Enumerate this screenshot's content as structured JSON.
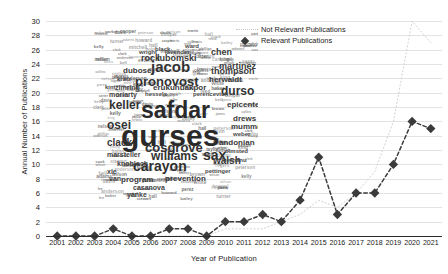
{
  "chart_data": {
    "type": "line",
    "title": "",
    "xlabel": "Year of Publication",
    "ylabel": "Annual Number of Publications",
    "x": [
      2001,
      2002,
      2003,
      2004,
      2005,
      2006,
      2007,
      2008,
      2009,
      2010,
      2011,
      2012,
      2013,
      2014,
      2015,
      2016,
      2017,
      2018,
      2019,
      2020,
      2021
    ],
    "xticks": [
      "2001",
      "2002",
      "2003",
      "2004",
      "2005",
      "2006",
      "2007",
      "2008",
      "2009",
      "2010",
      "2011",
      "2012",
      "2013",
      "2014",
      "2015",
      "2016",
      "2017",
      "2018",
      "2019",
      "2020",
      "2021"
    ],
    "yticks": [
      0,
      2,
      4,
      6,
      8,
      10,
      12,
      14,
      16,
      18,
      20,
      22,
      24,
      26,
      28,
      30
    ],
    "ylim": [
      0,
      31
    ],
    "xlim": [
      2000.4,
      2021.6
    ],
    "grid": true,
    "legend_position": "upper center",
    "series": [
      {
        "name": "Not Relevant Publications",
        "style": "dotted-line",
        "color": "#d2d2d2",
        "marker": "none",
        "values": [
          0,
          0,
          0,
          0,
          0,
          0,
          0,
          0,
          0,
          1,
          1,
          1,
          2,
          3,
          5,
          4,
          6,
          9,
          16,
          30,
          27
        ]
      },
      {
        "name": "Relevant Publications",
        "style": "dashed-line",
        "color": "#3b3b3b",
        "marker": "diamond",
        "values": [
          0,
          0,
          0,
          1,
          0,
          0,
          1,
          1,
          0,
          2,
          2,
          3,
          2,
          5,
          11,
          3,
          6,
          6,
          10,
          16,
          15
        ]
      }
    ]
  },
  "legend": {
    "items": [
      {
        "label": "Not Relevant Publications"
      },
      {
        "label": "Relevant Publications"
      }
    ]
  },
  "wordcloud": {
    "title": "author-name-word-cloud",
    "words": [
      {
        "text": "gurses",
        "size": 30,
        "x": 28,
        "y": 92,
        "rot": 0,
        "weight": 700,
        "color": "#2a2a2a"
      },
      {
        "text": "safdar",
        "size": 23,
        "x": 48,
        "y": 70,
        "rot": 0,
        "weight": 700,
        "color": "#2a2a2a"
      },
      {
        "text": "jacob",
        "size": 15,
        "x": 58,
        "y": 30,
        "rot": 0,
        "weight": 700,
        "color": "#333"
      },
      {
        "text": "pronovost",
        "size": 13,
        "x": 42,
        "y": 46,
        "rot": 0,
        "weight": 700,
        "color": "#333"
      },
      {
        "text": "carayon",
        "size": 14,
        "x": 40,
        "y": 130,
        "rot": 0,
        "weight": 700,
        "color": "#2f2f2f"
      },
      {
        "text": "cosgrove",
        "size": 13,
        "x": 52,
        "y": 112,
        "rot": 0,
        "weight": 700,
        "color": "#333"
      },
      {
        "text": "williams",
        "size": 12,
        "x": 58,
        "y": 121,
        "rot": 0,
        "weight": 700,
        "color": "#333"
      },
      {
        "text": "keller",
        "size": 12,
        "x": 16,
        "y": 70,
        "rot": 0,
        "weight": 700,
        "color": "#333"
      },
      {
        "text": "durso",
        "size": 12,
        "x": 128,
        "y": 56,
        "rot": 0,
        "weight": 700,
        "color": "#333"
      },
      {
        "text": "osei",
        "size": 12,
        "x": 14,
        "y": 90,
        "rot": 0,
        "weight": 700,
        "color": "#333"
      },
      {
        "text": "clack",
        "size": 10,
        "x": 14,
        "y": 109,
        "rot": 0,
        "weight": 700,
        "color": "#3a3a3a"
      },
      {
        "text": "sax",
        "size": 14,
        "x": 110,
        "y": 119,
        "rot": 0,
        "weight": 700,
        "color": "#2f2f2f"
      },
      {
        "text": "walsh",
        "size": 10,
        "x": 120,
        "y": 127,
        "rot": 0,
        "weight": 700,
        "color": "#3a3a3a"
      },
      {
        "text": "martinez",
        "size": 9,
        "x": 126,
        "y": 33,
        "rot": 0,
        "weight": 700,
        "color": "#3a3a3a"
      },
      {
        "text": "thompson",
        "size": 9,
        "x": 118,
        "y": 38,
        "rot": 0,
        "weight": 700,
        "color": "#3a3a3a"
      },
      {
        "text": "chen",
        "size": 9,
        "x": 118,
        "y": 19,
        "rot": 0,
        "weight": 700,
        "color": "#3a3a3a"
      },
      {
        "text": "rock",
        "size": 9,
        "x": 48,
        "y": 25,
        "rot": 0,
        "weight": 700,
        "color": "#3a3a3a"
      },
      {
        "text": "lubomski",
        "size": 9,
        "x": 64,
        "y": 25,
        "rot": 0,
        "weight": 700,
        "color": "#3a3a3a"
      },
      {
        "text": "dubose",
        "size": 8,
        "x": 30,
        "y": 38,
        "rot": 0,
        "weight": 700,
        "color": "#3a3a3a"
      },
      {
        "text": "erukunuakpor",
        "size": 8,
        "x": 60,
        "y": 55,
        "rot": 0,
        "weight": 700,
        "color": "#3a3a3a"
      },
      {
        "text": "herwaldt",
        "size": 8,
        "x": 116,
        "y": 47,
        "rot": 0,
        "weight": 700,
        "color": "#3a3a3a"
      },
      {
        "text": "epicenters",
        "size": 8,
        "x": 134,
        "y": 72,
        "rot": 0,
        "weight": 700,
        "color": "#3a3a3a"
      },
      {
        "text": "drews",
        "size": 8,
        "x": 140,
        "y": 86,
        "rot": 0,
        "weight": 700,
        "color": "#3a3a3a"
      },
      {
        "text": "mumma",
        "size": 8,
        "x": 138,
        "y": 94,
        "rot": 0,
        "weight": 700,
        "color": "#3a3a3a"
      },
      {
        "text": "andonian",
        "size": 8,
        "x": 126,
        "y": 110,
        "rot": 0,
        "weight": 700,
        "color": "#3a3a3a"
      },
      {
        "text": "zimring",
        "size": 7,
        "x": 22,
        "y": 55,
        "rot": 0,
        "weight": 700,
        "color": "#444"
      },
      {
        "text": "moriarty",
        "size": 7,
        "x": 16,
        "y": 62,
        "rot": 0,
        "weight": 700,
        "color": "#444"
      },
      {
        "text": "marsteller",
        "size": 7,
        "x": 14,
        "y": 122,
        "rot": 0,
        "weight": 700,
        "color": "#444"
      },
      {
        "text": "knobloch",
        "size": 7,
        "x": 24,
        "y": 131,
        "rot": 0,
        "weight": 700,
        "color": "#444"
      },
      {
        "text": "xie",
        "size": 7,
        "x": 14,
        "y": 139,
        "rot": 0,
        "weight": 700,
        "color": "#444"
      },
      {
        "text": "van",
        "size": 7,
        "x": 16,
        "y": 146,
        "rot": 0,
        "weight": 700,
        "color": "#444"
      },
      {
        "text": "program",
        "size": 8,
        "x": 28,
        "y": 147,
        "rot": 0,
        "weight": 700,
        "color": "#3a3a3a"
      },
      {
        "text": "prevention",
        "size": 8,
        "x": 72,
        "y": 146,
        "rot": 0,
        "weight": 700,
        "color": "#3a3a3a"
      },
      {
        "text": "casanova",
        "size": 7,
        "x": 40,
        "y": 155,
        "rot": 0,
        "weight": 700,
        "color": "#444"
      },
      {
        "text": "yanke",
        "size": 7,
        "x": 34,
        "y": 162,
        "rot": 0,
        "weight": 700,
        "color": "#444"
      },
      {
        "text": "pettinger",
        "size": 6,
        "x": 112,
        "y": 139,
        "rot": 0,
        "weight": 700,
        "color": "#4a4a4a"
      },
      {
        "text": "berhanu",
        "size": 6,
        "x": 130,
        "y": 128,
        "rot": 0,
        "weight": 700,
        "color": "#4a4a4a"
      },
      {
        "text": "weber",
        "size": 6,
        "x": 140,
        "y": 102,
        "rot": 0,
        "weight": 700,
        "color": "#4a4a4a"
      },
      {
        "text": "black",
        "size": 6,
        "x": 62,
        "y": 17,
        "rot": 0,
        "weight": 700,
        "color": "#4a4a4a"
      },
      {
        "text": "wright",
        "size": 6,
        "x": 46,
        "y": 20,
        "rot": 0,
        "weight": 700,
        "color": "#4a4a4a"
      },
      {
        "text": "lavender",
        "size": 6,
        "x": 72,
        "y": 20,
        "rot": 0,
        "weight": 700,
        "color": "#4a4a4a"
      },
      {
        "text": "perencevich",
        "size": 6,
        "x": 100,
        "y": 62,
        "rot": 0,
        "weight": 700,
        "color": "#4a4a4a"
      },
      {
        "text": "kratz",
        "size": 6,
        "x": 24,
        "y": 47,
        "rot": 0,
        "weight": 700,
        "color": "#4a4a4a"
      },
      {
        "text": "hessels",
        "size": 6,
        "x": 52,
        "y": 62,
        "rot": 0,
        "weight": 700,
        "color": "#4a4a4a"
      },
      {
        "text": "olmsted",
        "size": 6,
        "x": 132,
        "y": 119,
        "rot": 0,
        "weight": 700,
        "color": "#4a4a4a"
      },
      {
        "text": "kim",
        "size": 6,
        "x": 12,
        "y": 55,
        "rot": 0,
        "weight": 700,
        "color": "#4a4a4a"
      },
      {
        "text": "ward",
        "size": 6,
        "x": 92,
        "y": 14,
        "rot": 0,
        "weight": 700,
        "color": "#4a4a4a"
      }
    ]
  }
}
